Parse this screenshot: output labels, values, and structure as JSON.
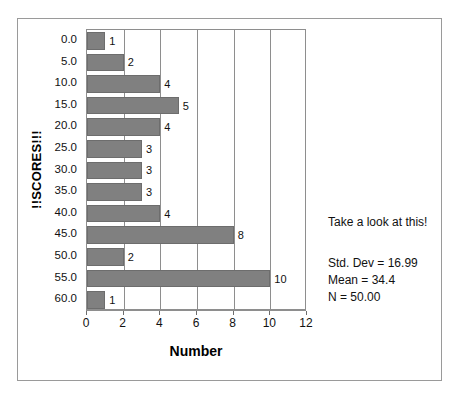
{
  "chart_data": {
    "type": "bar",
    "orientation": "horizontal",
    "title": "",
    "xlabel": "Number",
    "ylabel": "!!SCORES!!!",
    "categories": [
      "0.0",
      "5.0",
      "10.0",
      "15.0",
      "20.0",
      "25.0",
      "30.0",
      "35.0",
      "40.0",
      "45.0",
      "50.0",
      "55.0",
      "60.0"
    ],
    "values": [
      1,
      2,
      4,
      5,
      4,
      3,
      3,
      3,
      4,
      8,
      2,
      10,
      1
    ],
    "bar_labels": [
      "1",
      "2",
      "4",
      "5",
      "4",
      "3",
      "3",
      "3",
      "4",
      "8",
      "2",
      "10",
      "1"
    ],
    "xlim": [
      0,
      12
    ],
    "xticks": [
      0,
      2,
      4,
      6,
      8,
      10,
      12
    ],
    "xtick_labels": [
      "0",
      "2",
      "4",
      "6",
      "8",
      "10",
      "12"
    ],
    "grid": true,
    "grid_axis": "x",
    "legend": false,
    "bar_color": "#808080",
    "bar_edge_color": "#6d6d6d",
    "axis_color": "#8e8e8e",
    "frame_color": "#9a9a9a",
    "annotations": {
      "note": "Take a look at this!",
      "stats": [
        "Std. Dev = 16.99",
        "Mean = 34.4",
        "N = 50.00"
      ]
    }
  }
}
